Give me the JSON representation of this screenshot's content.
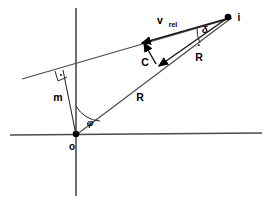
{
  "figure": {
    "type": "vector-geometry-diagram",
    "background_color": "#ffffff",
    "line_color": "#4a4a4a",
    "ink_color": "#000000"
  },
  "axes": {
    "horizontal_label": "",
    "vertical_label": "",
    "origin_label": "o"
  },
  "points": [
    {
      "id": "origin",
      "label": "o",
      "x": 76,
      "y": 135
    },
    {
      "id": "target",
      "label": "i",
      "x": 228,
      "y": 17
    }
  ],
  "vectors": [
    {
      "id": "R",
      "label": "R",
      "overdot": false,
      "description": "position vector from o to i"
    },
    {
      "id": "Rdot",
      "label": "R",
      "overdot": true,
      "description": "range rate vector at i"
    },
    {
      "id": "Cdot",
      "label": "C",
      "overdot": true,
      "description": "cross-range rate vector"
    },
    {
      "id": "vrel",
      "label": "v",
      "subscript": "rel",
      "overdot": false,
      "description": "relative velocity vector"
    }
  ],
  "segments": [
    {
      "id": "m",
      "label": "m",
      "description": "perpendicular miss distance from origin to v_rel line"
    }
  ],
  "angles": [
    {
      "id": "phi",
      "label": "φ",
      "vertex": "o",
      "description": "angle at origin between vertical axis and R"
    },
    {
      "id": "delta",
      "label": "δ",
      "vertex": "i",
      "description": "angle at i between v_rel line and R"
    },
    {
      "id": "right-angle",
      "label": "",
      "description": "right angle between m and the v_rel line"
    }
  ],
  "labels": {
    "origin": "o",
    "target": "i",
    "range": "R",
    "range_rate": "R",
    "cross_rate": "C",
    "vrel_base": "v",
    "vrel_sub": "rel",
    "miss_distance": "m",
    "angle_phi": "φ",
    "angle_delta": "δ"
  }
}
